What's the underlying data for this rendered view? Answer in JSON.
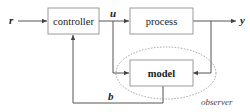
{
  "diagram": {
    "type": "block-diagram",
    "blocks": {
      "controller": {
        "label": "controller"
      },
      "process": {
        "label": "process"
      },
      "model": {
        "label": "model"
      }
    },
    "signals": {
      "reference": "r",
      "control": "u",
      "output": "y",
      "feedback": "b"
    },
    "groups": {
      "observer": {
        "label": "observer"
      }
    },
    "colors": {
      "line": "#555555",
      "box_border": "#9a9a9a",
      "text": "#222222"
    }
  }
}
